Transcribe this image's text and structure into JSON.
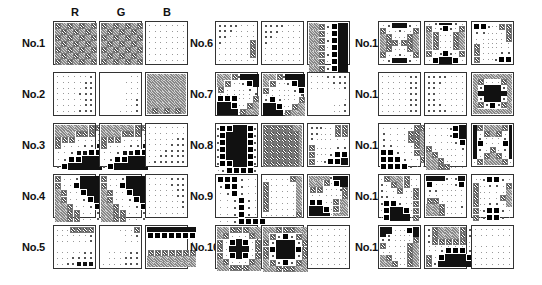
{
  "figure": {
    "channel_headers": [
      "R",
      "G",
      "B"
    ],
    "legend": {
      ".": "blank",
      ",": "tiny dot",
      "o": "small square",
      "O": "medium square",
      "B": "large black square",
      "#": "solid black",
      "x": "cross-hatch symbol",
      "g": "gray checker fill"
    },
    "columns": [
      {
        "label_x": 22,
        "panel_x": [
          53,
          99,
          145
        ]
      },
      {
        "label_x": 190,
        "panel_x": [
          215,
          261,
          307
        ]
      },
      {
        "label_x": 355,
        "panel_x": [
          378,
          424,
          471
        ]
      }
    ],
    "row_y": [
      21,
      72,
      123,
      174,
      225
    ],
    "panels": [
      {
        "label": "No.1",
        "col": 0,
        "row": 0,
        "R": [
          "xgxgxgx",
          "gxgxgxg",
          "xgxgxgx",
          "gxgxgxg",
          "xgxgxgx",
          "gxgxgxg",
          "xgxgxgx"
        ],
        "G": [
          "xgxgxgx",
          "gxgxgxg",
          "xgxgxgx",
          "gxgxgxg",
          "xgxgxgx",
          "gxgxgxg",
          "xgxgxgx"
        ],
        "B": [
          ",,,,,,,",
          ",,,,,,,",
          ",,,,,,,",
          ",,,,,,,",
          ",,,,,,,",
          ",,,,,,,",
          ",,,,,,,"
        ]
      },
      {
        "label": "No.2",
        "col": 0,
        "row": 1,
        "R": [
          ",,,,,,o",
          ",,,,,oo",
          ",,,,,oo",
          ",,,,ooo",
          ",,,,,oo",
          ",,,,,oo",
          ",,,,ooo"
        ],
        "G": [
          ".....,,",
          "....,,,",
          ".....,,",
          "....,,,",
          "....,,o",
          "....,,o",
          "...,,,o"
        ],
        "B": [
          "ggggggg",
          "ggggggg",
          "ggggggg",
          "ggggggg",
          "ggggggg",
          "ggggggg",
          "gxgxgxg"
        ]
      },
      {
        "label": "No.3",
        "col": 0,
        "row": 2,
        "R": [
          "gggggxx",
          "gggxxx,",
          "xxx,,,,",
          "x,,,ooO",
          ",,oOOBB",
          ",oBB###",
          "oB#####"
        ],
        "G": [
          "gggggxx",
          "gggxxx,",
          "xxx,,,,",
          "x,,,ooO",
          ",,oOOBB",
          ",oBB###",
          "oB#####"
        ],
        "B": [
          ",,,,,,,",
          ",,,,,,,",
          ",,,,,oo",
          ",,,,ooo",
          ",,,oooo",
          ",,ooooo",
          ",oooooo"
        ]
      },
      {
        "label": "No.4",
        "col": 0,
        "row": 3,
        "R": [
          "x,,o###",
          "x,,B###",
          "gx,,B##",
          "gx,,oB#",
          "ggx,,oB",
          "ggxx,,o",
          "ggxx,,o"
        ],
        "G": [
          "x,,o###",
          "x,,B###",
          "gx,,B##",
          "gx,,oB#",
          "ggx,,oB",
          "ggxx,,o",
          "ggxx,,o"
        ],
        "B": [
          ",,,,ooo",
          ",,,,ooo",
          ",,,,,oo",
          ",,,,,oo",
          ",,,,,,o",
          ",,,,,,o",
          ",,,,,,,"
        ]
      },
      {
        "label": "No.5",
        "col": 0,
        "row": 4,
        "R": [
          ",,,xxxx",
          ",,,,,,o",
          ",,,,,,o",
          ".......",
          ",,,,,oo",
          ",,,oooo",
          ",,ooOOO"
        ],
        "G": [
          "...,,,x",
          "....,,o",
          "....,,,",
          ".......",
          ".,,,,oo",
          ".,,,ooo",
          ",,,,ooo"
        ],
        "B": [
          "#######",
          "BBBBBBB",
          "......,",
          ".......",
          "xxxxxxx",
          "ggggggg",
          "ggggggg"
        ]
      },
      {
        "label": "No.6",
        "col": 1,
        "row": 0,
        "R": [
          "oooo,,,",
          "ooo,,,,",
          "oo,,,,,",
          "o,,,,,x",
          ",,,,,,x",
          ",,,,,,x",
          ",,,,,,,"
        ],
        "G": [
          "oooo,,,",
          "ooo,,,,",
          "oo,,,,,",
          "o,,,,,,",
          ",,,,,,,",
          ",,,,,,,",
          ",,,,,,,"
        ],
        "B": [
          "ggxoB##",
          "ggx,B##",
          "ggxoB##",
          "ggx,B##",
          "ggxoB##",
          "ggx,B##",
          "ggxoB##"
        ]
      },
      {
        "label": "No.7",
        "col": 1,
        "row": 1,
        "R": [
          "ggxo###",
          "gx,,oB#",
          "x,,,,ob",
          ",,,,,,o",
          "BBB,,,x",
          "##B,,xg",
          "###,xgg"
        ],
        "G": [
          "ggxo###",
          "gx,,oB#",
          "x,,,,oB",
          ",,,,,,o",
          "oBo,,,x",
          "##B,,xg",
          "###,xgg"
        ],
        "B": [
          ",,,oooo",
          ",,,,ooo",
          ",,,,,,o",
          ".......",
          "......,",
          "....,,o",
          "....,,o"
        ]
      },
      {
        "label": "No.8",
        "col": 1,
        "row": 2,
        "R": [
          "oBB##Bo",
          "oB###Bo",
          "oB###Bo",
          "oB###Bo",
          "oB###Bo",
          "oBB##Bo",
          ",oBBBBo"
        ],
        "G": [
          "xxxxxgg",
          "xxxxxxg",
          "xxxxxxg",
          "xxxxxxg",
          "xxxxxxg",
          "xxxxxxg",
          "xxxxxxg"
        ],
        "B": [
          "ooo,,xx",
          "oo,,,xx",
          "o,,,,,,",
          ".......",
          "x,,,,oo",
          "x,,,oBB",
          "x,,oBB#"
        ]
      },
      {
        "label": "No.9",
        "col": 1,
        "row": 3,
        "R": [
          "BBBo,,,",
          "oBBo,,,",
          ",oBo,,,",
          ",,oBo,,",
          ",,oBo,,",
          ",,oBo,,",
          ",,oBBBB"
        ],
        "G": [
          ",,,,,xg",
          "x,,,,,g",
          "x,,,,,g",
          "x,,,,,g",
          "x,,,,,g",
          "x,,,,,g",
          ",,,,,,x"
        ],
        "B": [
          "gggo###",
          "ggx,B##",
          "xx,,,ox",
          ",,,,,,x",
          "BB,,xgg",
          "##B,xgg",
          "###,ggg"
        ]
      },
      {
        "label": "No.10",
        "col": 1,
        "row": 4,
        "R": [
          "ggxxxgg",
          "gx,,,xg",
          "x,B#B,x",
          "x,###,x",
          "x,B#B,x",
          "gx,,,xg",
          "ggxxxgg"
        ],
        "G": [
          "ggxxxgg",
          "gxoBoxg",
          "xo###ox",
          "xB###Bx",
          "xo###ox",
          "gxoBoxg",
          "ggxxxgg"
        ],
        "B": [
          ",,,,,,,",
          ",,,,,,,",
          ",,,,,,,",
          ",,,,,,,",
          ",,,,,,,",
          ",,,,,,,",
          ",,,,,,,"
        ]
      },
      {
        "label": "No.11",
        "col": 2,
        "row": 0,
        "R": [
          ",o###o,",
          "x,,o,,x",
          "gx,,,xg",
          "gxx,xxg",
          "gx,,,xg",
          "x,,o,,x",
          ",o###o,"
        ],
        "G": [
          ",o###o,",
          "x,oBo,x",
          "gx,,,xg",
          "gx,,,xg",
          "gx,,,xg",
          "x,oBo,x",
          ",B###B,"
        ],
        "B": [
          "BBo,,xx",
          "oo,,,,x",
          ",,,,,,x",
          ",,,,,,,",
          "x,,,,,,",
          "x,,,,oo",
          "x,,,oBB"
        ]
      },
      {
        "label": "No.12",
        "col": 2,
        "row": 1,
        "R": [
          ",,,,,oo",
          ",,,,,oo",
          ",,,,,oo",
          ",,,,,oo",
          ",,,,,oo",
          ",,,,,oo",
          ",,,,,oo"
        ],
        "G": [
          "oooo,,,",
          "ooo,,,,",
          "oo,,,,,",
          "oo,,,,,",
          "oo,,,,,",
          "ooo,,,,",
          "oooo,,,"
        ],
        "B": [
          "ggggggg",
          "gx,,,xg",
          "go###og",
          "g#####g",
          "go###og",
          "gxoBoxg",
          "ggggggg"
        ]
      },
      {
        "label": "No.13",
        "col": 2,
        "row": 2,
        "R": [
          ",,,,,xx",
          "o,,,xxg",
          "o,,,xxg",
          "oo,,,xg",
          "BBo,,xg",
          "BBBo,,x",
          "BBBBo,,"
        ],
        "G": [
          ",,,,oB#",
          ",,,,oB#",
          ",,,,,oB",
          "x,,,,,o",
          "gx,,,,,",
          "ggx,,,,",
          "ggxx,,,"
        ],
        "B": [
          "#xgggx#",
          "#,xgx,#",
          "#o,,,o#",
          "#B,,,B#",
          "#o,x,o#",
          "#,xgx,#",
          ",xgggx,"
        ]
      },
      {
        "label": "No.14",
        "col": 2,
        "row": 3,
        "R": [
          ",xggx,,",
          "o,xgx,,",
          "o,,x,,x",
          "oo,,,,x",
          "oBBo,,x",
          ",B##B,x",
          ",B###,x"
        ],
        "G": [
          "###o,o#",
          "B,,,,oB",
          "oo,,,,,",
          ",,,,,,,",
          "xx,,,,,",
          "ggx,,,o",
          "ggx,,,,"
        ],
        "B": [
          ",,oBBo,",
          "x,,oo,x",
          "x,,,,,g",
          "x,,,,xg",
          "x,,oo,g",
          "x,oBBo,",
          "x,oBBo,"
        ]
      },
      {
        "label": "No.15",
        "col": 2,
        "row": 4,
        "R": [
          "##,,,B#",
          "#o,,,,#",
          "oo,,,,x",
          "x,,,,xg",
          ",,,,,xg",
          "gx,,,xg",
          "ggx,,xg"
        ],
        "G": [
          "oxgggxo",
          "oxgggxo",
          "oxxxxx,",
          ",,,,,,,",
          ",,oBBBo",
          "x,B###B",
          "xo#####"
        ],
        "B": [
          ",,,,,,,",
          ",,,,,,,",
          ".......",
          ",,,,,,,",
          ",,,,,,,",
          ",,,,,,,",
          ",,,,,,,"
        ]
      }
    ]
  }
}
